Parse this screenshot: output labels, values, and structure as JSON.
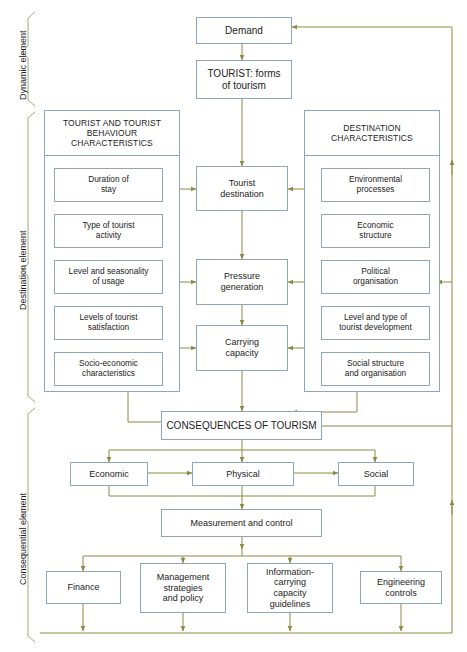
{
  "colors": {
    "box_border": "#8ba6bd",
    "arrow": "#8a8a43",
    "bracket": "#a8a87a",
    "text": "#1b1b1b",
    "background": "#ffffff"
  },
  "side_labels": [
    {
      "id": "dynamic",
      "label": "Dynamic element"
    },
    {
      "id": "destination",
      "label": "Destination element"
    },
    {
      "id": "consequential",
      "label": "Consequential element"
    }
  ],
  "dynamic_element": {
    "boxes": [
      {
        "id": "demand",
        "label": "Demand"
      },
      {
        "id": "tourist-forms",
        "label": "TOURIST: forms\nof tourism"
      }
    ]
  },
  "destination_element": {
    "left_panel": {
      "title": "TOURIST AND TOURIST\nBEHAVIOUR\nCHARACTERISTICS",
      "items": [
        {
          "id": "duration-of-stay",
          "label": "Duration of\nstay"
        },
        {
          "id": "type-of-tourist-activity",
          "label": "Type of tourist\nactivity"
        },
        {
          "id": "level-and-seasonality-of-usage",
          "label": "Level and seasonality\nof usage"
        },
        {
          "id": "levels-of-tourist-satisfaction",
          "label": "Levels of tourist\nsatisfaction"
        },
        {
          "id": "socio-economic-characteristics",
          "label": "Socio-economic\ncharacteristics"
        }
      ]
    },
    "centre_boxes": [
      {
        "id": "tourist-destination",
        "label": "Tourist\ndestination"
      },
      {
        "id": "pressure-generation",
        "label": "Pressure\ngeneration"
      },
      {
        "id": "carrying-capacity",
        "label": "Carrying\ncapacity"
      }
    ],
    "right_panel": {
      "title": "DESTINATION\nCHARACTERISTICS",
      "items": [
        {
          "id": "environmental-processes",
          "label": "Environmental\nprocesses"
        },
        {
          "id": "economic-structure",
          "label": "Economic\nstructure"
        },
        {
          "id": "political-organisation",
          "label": "Political\norganisation"
        },
        {
          "id": "level-and-type-of-tourist-development",
          "label": "Level and type of\ntourist development"
        },
        {
          "id": "social-structure-and-organisation",
          "label": "Social structure\nand organisation"
        }
      ]
    }
  },
  "consequential_element": {
    "header_box": {
      "id": "consequences-of-tourism",
      "label": "CONSEQUENCES OF TOURISM"
    },
    "impact_boxes": [
      {
        "id": "economic",
        "label": "Economic"
      },
      {
        "id": "physical",
        "label": "Physical"
      },
      {
        "id": "social",
        "label": "Social"
      }
    ],
    "measurement_box": {
      "id": "measurement-and-control",
      "label": "Measurement and control"
    },
    "response_boxes": [
      {
        "id": "finance",
        "label": "Finance"
      },
      {
        "id": "management-strategies-and-policy",
        "label": "Management\nstrategies\nand policy"
      },
      {
        "id": "information-carrying-capacity-guidelines",
        "label": "Information-\ncarrying\ncapacity\nguidelines"
      },
      {
        "id": "engineering-controls",
        "label": "Engineering\ncontrols"
      }
    ]
  }
}
